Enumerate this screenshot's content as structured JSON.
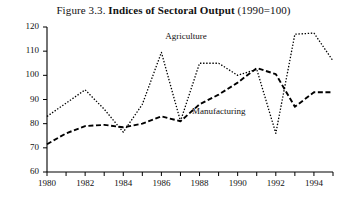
{
  "figure": {
    "number": "Figure 3.3.",
    "title": "Indices of Sectoral Output",
    "suffix": "(1990=100)"
  },
  "chart_data": {
    "type": "line",
    "title": "Figure 3.3. Indices of Sectoral Output (1990=100)",
    "xlabel": "",
    "ylabel": "",
    "xlim": [
      1980,
      1995
    ],
    "ylim": [
      60,
      120
    ],
    "yticks": [
      60,
      70,
      80,
      90,
      100,
      110,
      120
    ],
    "xticks": [
      1980,
      1981,
      1982,
      1983,
      1984,
      1985,
      1986,
      1987,
      1988,
      1989,
      1990,
      1991,
      1992,
      1993,
      1994,
      1995
    ],
    "xticklabels": [
      "1980",
      "",
      "1982",
      "",
      "1984",
      "",
      "1986",
      "",
      "1988",
      "",
      "1990",
      "",
      "1992",
      "",
      "1994",
      ""
    ],
    "grid": false,
    "legend": "inline-annotations",
    "x": [
      1980,
      1981,
      1982,
      1983,
      1984,
      1985,
      1986,
      1987,
      1988,
      1989,
      1990,
      1991,
      1992,
      1993,
      1994,
      1995
    ],
    "series": [
      {
        "name": "Agriculture",
        "style": "dotted",
        "color": "#000000",
        "label_x": 1986.2,
        "label_y": 116,
        "values": [
          83,
          88.5,
          94,
          86,
          76.5,
          88,
          109.5,
          81,
          105,
          105,
          100,
          102.5,
          76,
          117,
          117.5,
          106
        ]
      },
      {
        "name": "Manufacturing",
        "style": "dashed",
        "color": "#000000",
        "label_x": 1987.6,
        "label_y": 85,
        "values": [
          71.5,
          76,
          79,
          79.5,
          78.5,
          80,
          83,
          81,
          88,
          92,
          97,
          103,
          100.5,
          87,
          93,
          93
        ]
      }
    ]
  },
  "axis": {
    "y_ticks": [
      "120",
      "110",
      "100",
      "90",
      "80",
      "70",
      "60"
    ],
    "x_ticks": [
      "1980",
      "1982",
      "1984",
      "1986",
      "1988",
      "1990",
      "1992",
      "1994"
    ]
  }
}
